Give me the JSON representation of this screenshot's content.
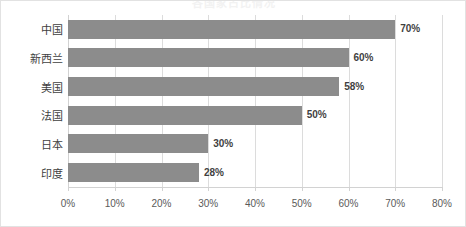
{
  "chart_data": {
    "type": "bar",
    "orientation": "horizontal",
    "title": "各国家占比情况",
    "categories": [
      "中国",
      "新西兰",
      "美国",
      "法国",
      "日本",
      "印度"
    ],
    "values": [
      70,
      60,
      58,
      50,
      30,
      28
    ],
    "value_labels": [
      "70%",
      "60%",
      "58%",
      "50%",
      "30%",
      "28%"
    ],
    "xlabel": "",
    "ylabel": "",
    "xlim": [
      0,
      80
    ],
    "xticks": [
      0,
      10,
      20,
      30,
      40,
      50,
      60,
      70,
      80
    ],
    "xtick_labels": [
      "0%",
      "10%",
      "20%",
      "30%",
      "40%",
      "50%",
      "60%",
      "70%",
      "80%"
    ],
    "grid": true,
    "grid_axis": "x",
    "legend": false,
    "series_color": "#8c8c8c",
    "gridline_color": "#dcdcdc",
    "label_color": "#3f3f3f",
    "background_color": "#ffffff",
    "border_color": "#e2e2e2"
  }
}
